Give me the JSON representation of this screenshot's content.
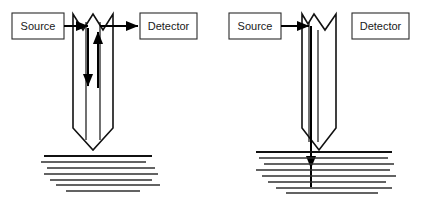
{
  "figure": {
    "background_color": "#ffffff",
    "line_color": "#111111",
    "text_color": "#1a1a1a",
    "width": 422,
    "height": 202
  },
  "panels": [
    {
      "id": "left",
      "name": "non-contact-reflective-configuration",
      "source_label": "Source",
      "detector_label": "Detector",
      "beam_outgoing": true,
      "beam_returning": true,
      "probe_contacts_surface": false,
      "source_box": {
        "x": 12,
        "y": 13,
        "width": 52,
        "height": 26
      },
      "detector_box": {
        "x": 140,
        "y": 13,
        "width": 57,
        "height": 26
      },
      "probe": {
        "left_x": 73,
        "right_x": 113,
        "top_y": 14,
        "taper_y": 128,
        "tip_y": 150,
        "notch_apex_y": 30,
        "inner_left_x": 86,
        "inner_right_x": 100
      },
      "arrow_in": {
        "x1": 64,
        "x2": 86,
        "y": 26
      },
      "arrow_out": {
        "x1": 100,
        "x2": 140,
        "y": 26
      },
      "arrow_down": {
        "x": 88,
        "y1": 30,
        "y2": 84
      },
      "arrow_up": {
        "x": 98,
        "y1": 84,
        "y2": 34
      },
      "ground": {
        "surface_y": 156,
        "surface_x1": 44,
        "surface_x2": 152,
        "lines": [
          {
            "x1": 41,
            "x2": 146,
            "y": 162,
            "width": 1.5
          },
          {
            "x1": 47,
            "x2": 155,
            "y": 168,
            "width": 1.4
          },
          {
            "x1": 44,
            "x2": 158,
            "y": 174,
            "width": 1.6
          },
          {
            "x1": 50,
            "x2": 152,
            "y": 180,
            "width": 1.3
          },
          {
            "x1": 56,
            "x2": 160,
            "y": 185,
            "width": 1.5
          },
          {
            "x1": 66,
            "x2": 140,
            "y": 191,
            "width": 1.4
          }
        ]
      }
    },
    {
      "id": "right",
      "name": "penetrating-contact-configuration",
      "source_label": "Source",
      "detector_label": "Detector",
      "beam_outgoing": true,
      "beam_returning": false,
      "probe_contacts_surface": true,
      "source_box": {
        "x": 229,
        "y": 13,
        "width": 52,
        "height": 26
      },
      "detector_box": {
        "x": 352,
        "y": 13,
        "width": 57,
        "height": 26
      },
      "probe": {
        "left_x": 302,
        "right_x": 336,
        "top_y": 14,
        "taper_y": 128,
        "tip_y": 150,
        "notch_apex_y": 30,
        "inner_left_x": 309,
        "inner_right_x": 318
      },
      "arrow_in": {
        "x1": 281,
        "x2": 309,
        "y": 26
      },
      "arrow_down": {
        "x": 311,
        "y1": 26,
        "y2": 166
      },
      "beam_tail": {
        "x": 311,
        "y1": 166,
        "y2": 187
      },
      "ground": {
        "surface_y": 152,
        "surface_x1": 256,
        "surface_x2": 392,
        "lines": [
          {
            "x1": 259,
            "x2": 388,
            "y": 158,
            "width": 1.4
          },
          {
            "x1": 264,
            "x2": 394,
            "y": 164,
            "width": 1.5
          },
          {
            "x1": 256,
            "x2": 390,
            "y": 170,
            "width": 1.4
          },
          {
            "x1": 262,
            "x2": 396,
            "y": 176,
            "width": 1.6
          },
          {
            "x1": 268,
            "x2": 386,
            "y": 182,
            "width": 1.3
          },
          {
            "x1": 276,
            "x2": 392,
            "y": 188,
            "width": 1.5
          },
          {
            "x1": 286,
            "x2": 378,
            "y": 193,
            "width": 1.3
          }
        ]
      }
    }
  ]
}
